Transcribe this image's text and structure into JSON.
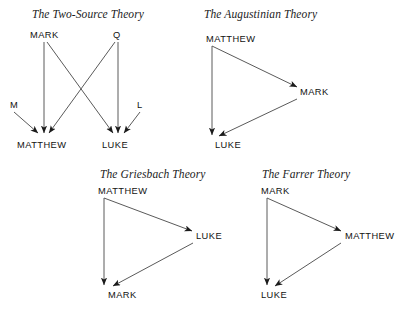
{
  "page": {
    "width": 409,
    "height": 313,
    "background": "#ffffff",
    "ink_color": "#1b1b1b"
  },
  "diagrams": [
    {
      "id": "two-source",
      "title": "The Two-Source Theory",
      "nodes": [
        {
          "key": "mark",
          "label": "MARK"
        },
        {
          "key": "q",
          "label": "Q"
        },
        {
          "key": "m",
          "label": "M"
        },
        {
          "key": "l",
          "label": "L"
        },
        {
          "key": "matthew",
          "label": "MATTHEW"
        },
        {
          "key": "luke",
          "label": "LUKE"
        }
      ],
      "edges": [
        {
          "from": "MARK",
          "to": "MATTHEW"
        },
        {
          "from": "MARK",
          "to": "LUKE"
        },
        {
          "from": "Q",
          "to": "MATTHEW"
        },
        {
          "from": "Q",
          "to": "LUKE"
        },
        {
          "from": "M",
          "to": "MATTHEW"
        },
        {
          "from": "L",
          "to": "LUKE"
        }
      ]
    },
    {
      "id": "augustinian",
      "title": "The Augustinian Theory",
      "nodes": [
        {
          "key": "matthew",
          "label": "MATTHEW"
        },
        {
          "key": "mark",
          "label": "MARK"
        },
        {
          "key": "luke",
          "label": "LUKE"
        }
      ],
      "edges": [
        {
          "from": "MATTHEW",
          "to": "MARK"
        },
        {
          "from": "MATTHEW",
          "to": "LUKE"
        },
        {
          "from": "MARK",
          "to": "LUKE"
        }
      ]
    },
    {
      "id": "griesbach",
      "title": "The Griesbach Theory",
      "nodes": [
        {
          "key": "matthew",
          "label": "MATTHEW"
        },
        {
          "key": "luke",
          "label": "LUKE"
        },
        {
          "key": "mark",
          "label": "MARK"
        }
      ],
      "edges": [
        {
          "from": "MATTHEW",
          "to": "LUKE"
        },
        {
          "from": "MATTHEW",
          "to": "MARK"
        },
        {
          "from": "LUKE",
          "to": "MARK"
        }
      ]
    },
    {
      "id": "farrer",
      "title": "The Farrer Theory",
      "nodes": [
        {
          "key": "mark",
          "label": "MARK"
        },
        {
          "key": "matthew",
          "label": "MATTHEW"
        },
        {
          "key": "luke",
          "label": "LUKE"
        }
      ],
      "edges": [
        {
          "from": "MARK",
          "to": "MATTHEW"
        },
        {
          "from": "MARK",
          "to": "LUKE"
        },
        {
          "from": "MATTHEW",
          "to": "LUKE"
        }
      ]
    }
  ]
}
